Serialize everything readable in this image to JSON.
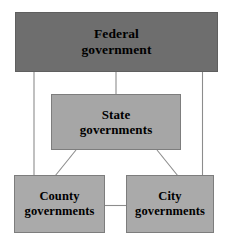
{
  "diagram": {
    "background_color": "#ffffff",
    "line_color": "#8c8c8c",
    "text_color": "#000000",
    "nodes": [
      {
        "id": "federal",
        "label_line1": "Federal",
        "label_line2": "government",
        "fill_color": "#6e6e6e",
        "level": "federal"
      },
      {
        "id": "state",
        "label_line1": "State",
        "label_line2": "governments",
        "fill_color": "#a6a6a6",
        "level": "state"
      },
      {
        "id": "county",
        "label_line1": "County",
        "label_line2": "governments",
        "fill_color": "#aaaaaa",
        "level": "local"
      },
      {
        "id": "city",
        "label_line1": "City",
        "label_line2": "governments",
        "fill_color": "#aaaaaa",
        "level": "local"
      }
    ],
    "edges": [
      {
        "id": "federal-state",
        "from": "federal",
        "to": "state",
        "style": "vertical"
      },
      {
        "id": "federal-county",
        "from": "federal",
        "to": "county",
        "style": "vertical"
      },
      {
        "id": "federal-city",
        "from": "federal",
        "to": "city",
        "style": "vertical"
      },
      {
        "id": "state-county",
        "from": "state",
        "to": "county",
        "style": "diagonal"
      },
      {
        "id": "state-city",
        "from": "state",
        "to": "city",
        "style": "diagonal"
      },
      {
        "id": "county-city",
        "from": "county",
        "to": "city",
        "style": "horizontal"
      }
    ]
  }
}
